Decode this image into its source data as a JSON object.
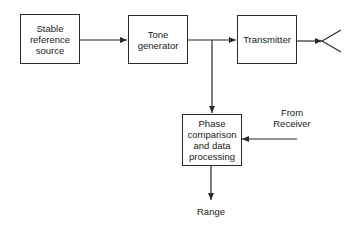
{
  "diagram": {
    "blocks": {
      "reference": "Stable reference source",
      "tone": "Tone generator",
      "transmitter": "Transmitter",
      "phase": "Phase comparison and data processing"
    },
    "labels": {
      "from_receiver_line1": "From",
      "from_receiver_line2": "Receiver",
      "range": "Range"
    },
    "icons": {
      "antenna": "antenna-icon"
    },
    "colors": {
      "line": "#2a2a2a",
      "background": "#ffffff"
    }
  }
}
